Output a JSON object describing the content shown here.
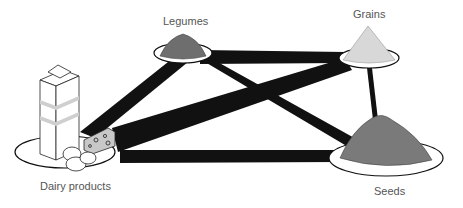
{
  "diagram": {
    "type": "complementary-protein-network",
    "nodes": [
      {
        "id": "legumes",
        "label": "Legumes"
      },
      {
        "id": "grains",
        "label": "Grains"
      },
      {
        "id": "dairy",
        "label": "Dairy products"
      },
      {
        "id": "seeds",
        "label": "Seeds"
      }
    ],
    "edges": [
      {
        "from": "legumes",
        "to": "grains",
        "weight": "thick"
      },
      {
        "from": "legumes",
        "to": "dairy",
        "weight": "thick"
      },
      {
        "from": "legumes",
        "to": "seeds",
        "weight": "medium"
      },
      {
        "from": "grains",
        "to": "dairy",
        "weight": "thick"
      },
      {
        "from": "grains",
        "to": "seeds",
        "weight": "thin"
      },
      {
        "from": "dairy",
        "to": "seeds",
        "weight": "thick"
      }
    ],
    "colors": {
      "edge": "#111111",
      "plate_fill": "#ffffff",
      "plate_stroke": "#111111",
      "legume": "#6e6e6e",
      "grain": "#d8d8d8",
      "seed": "#7a7a7a",
      "label": "#555555"
    }
  }
}
